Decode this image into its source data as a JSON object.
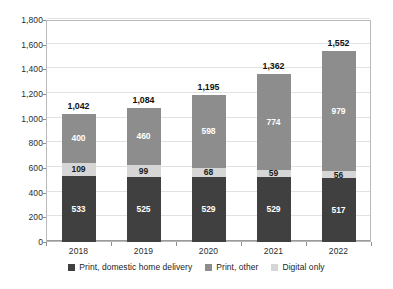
{
  "chart_data": {
    "type": "bar",
    "subtype": "stacked-vertical",
    "title": "",
    "xlabel": "",
    "ylabel": "",
    "categories": [
      "2018",
      "2019",
      "2020",
      "2021",
      "2022"
    ],
    "series": [
      {
        "name": "Print, domestic home delivery",
        "color": "#404040",
        "values": [
          533,
          525,
          529,
          529,
          517
        ],
        "labels": [
          "533",
          "525",
          "529",
          "529",
          "517"
        ]
      },
      {
        "name": "Digital only",
        "color": "#d6d6d6",
        "values": [
          109,
          99,
          68,
          59,
          56
        ],
        "labels": [
          "109",
          "99",
          "68",
          "59",
          "56"
        ]
      },
      {
        "name": "Print, other",
        "color": "#8d8d8d",
        "values": [
          400,
          460,
          598,
          774,
          979
        ],
        "labels": [
          "400",
          "460",
          "598",
          "774",
          "979"
        ]
      }
    ],
    "stack_order_bottom_to_top": [
      "Print, domestic home delivery",
      "Digital only",
      "Print, other"
    ],
    "totals": [
      1042,
      1084,
      1195,
      1362,
      1552
    ],
    "total_labels": [
      "1,042",
      "1,084",
      "1,195",
      "1,362",
      "1,552"
    ],
    "ylim": [
      0,
      1800
    ],
    "ytick_values": [
      0,
      200,
      400,
      600,
      800,
      1000,
      1200,
      1400,
      1600,
      1800
    ],
    "ytick_labels": [
      "0",
      "200",
      "400",
      "600",
      "800",
      "1,000",
      "1,200",
      "1,400",
      "1,600",
      "1,800"
    ],
    "grid": true,
    "legend_position": "bottom",
    "legend": [
      {
        "label": "Print, domestic home delivery",
        "color": "#404040"
      },
      {
        "label": "Print, other",
        "color": "#8d8d8d"
      },
      {
        "label": "Digital only",
        "color": "#d6d6d6"
      }
    ]
  }
}
